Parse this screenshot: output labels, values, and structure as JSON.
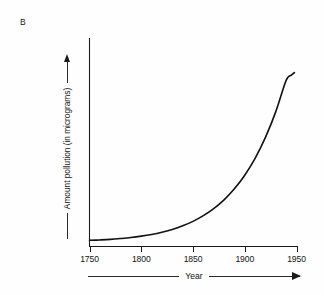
{
  "panel": {
    "letter": "B"
  },
  "axes": {
    "y": {
      "label": "Amount pollution (in micrograms)",
      "arrow_icon": "arrow-up-icon",
      "has_arrow": true
    },
    "x": {
      "label": "Year",
      "arrow_icon": "arrow-right-icon",
      "has_arrow": true,
      "tick_labels": [
        "1750",
        "1800",
        "1850",
        "1900",
        "1950"
      ]
    }
  },
  "colors": {
    "background": "#fefefe",
    "axis": "#1a1a1a",
    "curve": "#111111",
    "text": "#131313"
  },
  "chart_data": {
    "type": "line",
    "title": "",
    "subtitle": "",
    "xlabel": "Year",
    "ylabel": "Amount pollution (in micrograms)",
    "xlim": [
      1750,
      1950
    ],
    "ylim": [
      0,
      100
    ],
    "grid": false,
    "legend": null,
    "annotations": [
      "B"
    ],
    "xticks": [
      1750,
      1800,
      1850,
      1900,
      1950
    ],
    "xticklabels": [
      "1750",
      "1800",
      "1850",
      "1900",
      "1950"
    ],
    "yticks": [],
    "yticklabels": [],
    "series": [
      {
        "name": "Amount pollution",
        "x": [
          1750,
          1760,
          1770,
          1780,
          1790,
          1800,
          1810,
          1820,
          1830,
          1840,
          1850,
          1860,
          1870,
          1880,
          1890,
          1900,
          1910,
          1920,
          1930,
          1940,
          1945,
          1948
        ],
        "y": [
          1.0,
          1.2,
          1.5,
          2.0,
          2.6,
          3.4,
          4.4,
          5.7,
          7.3,
          9.4,
          12.0,
          15.3,
          19.4,
          24.5,
          30.9,
          38.8,
          48.6,
          60.8,
          75.8,
          94.0,
          97.0,
          98.5
        ]
      }
    ]
  }
}
